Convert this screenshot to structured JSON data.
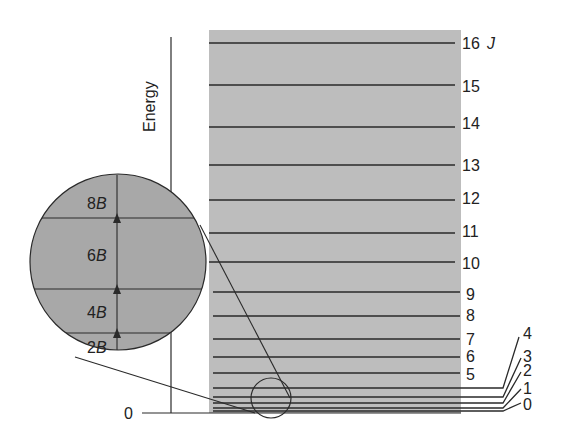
{
  "diagram": {
    "axis_label": "Energy",
    "zero_label": "0",
    "quantum_number_symbol": "J",
    "levels": [
      {
        "J": 0,
        "y": 410
      },
      {
        "J": 1,
        "y": 408
      },
      {
        "J": 2,
        "y": 403
      },
      {
        "J": 3,
        "y": 397
      },
      {
        "J": 4,
        "y": 388
      },
      {
        "J": 5,
        "y": 373
      },
      {
        "J": 6,
        "y": 357
      },
      {
        "J": 7,
        "y": 339
      },
      {
        "J": 8,
        "y": 316
      },
      {
        "J": 9,
        "y": 292
      },
      {
        "J": 10,
        "y": 262
      },
      {
        "J": 11,
        "y": 233
      },
      {
        "J": 12,
        "y": 200
      },
      {
        "J": 13,
        "y": 165
      },
      {
        "J": 14,
        "y": 127
      },
      {
        "J": 15,
        "y": 85
      },
      {
        "J": 16,
        "y": 43
      }
    ],
    "level_labels": {
      "j16": "16",
      "j15": "15",
      "j14": "14",
      "j13": "13",
      "j12": "12",
      "j11": "11",
      "j10": "10",
      "j9": "9",
      "j8": "8",
      "j7": "7",
      "j6": "6",
      "j5": "5",
      "j4": "4",
      "j3": "3",
      "j2": "2",
      "j1": "1",
      "j0": "0"
    },
    "magnifier": {
      "gap_labels": {
        "g1": {
          "num": "2",
          "sym": "B"
        },
        "g2": {
          "num": "4",
          "sym": "B"
        },
        "g3": {
          "num": "6",
          "sym": "B"
        },
        "g4": {
          "num": "8",
          "sym": "B"
        }
      }
    },
    "colors": {
      "band_fill": "#bdbdbd",
      "magnifier_fill": "#a8a8a8",
      "line": "#2a2a2a",
      "text": "#222222"
    }
  }
}
